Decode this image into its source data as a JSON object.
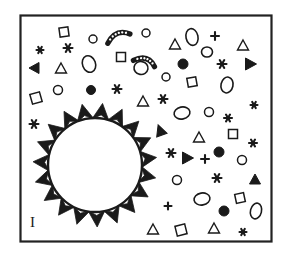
{
  "figure": {
    "panel_label": "I",
    "caption_visible": "",
    "background_color": "#ffffff",
    "ink_color": "#1a1a1a",
    "frame": {
      "x": 20.5,
      "y": 15.5,
      "width": 251,
      "height": 226,
      "stroke_width": 2.2,
      "color": "#222222"
    },
    "central_object": {
      "name": "spiked-circle",
      "center_x": 95,
      "center_y": 165,
      "radius": 47,
      "stroke_width": 2.4,
      "fill": "#ffffff",
      "spike_count": 19,
      "spike_length": 15,
      "spike_half_width": 8.5,
      "spike_notch": 5
    },
    "spike_angles_deg": [
      258,
      277,
      296,
      315,
      334,
      353,
      12,
      31,
      50,
      69,
      88,
      107,
      126,
      145,
      164,
      183,
      202,
      221,
      240
    ],
    "particles": [
      {
        "type": "square-open",
        "x": 64,
        "y": 32,
        "w": 9,
        "h": 9,
        "rot": -8
      },
      {
        "type": "circle-open",
        "x": 93,
        "y": 39,
        "w": 8,
        "h": 8,
        "rot": 0
      },
      {
        "type": "curved-rod",
        "x": 118,
        "y": 36,
        "w": 24,
        "h": 14,
        "rot": -18
      },
      {
        "type": "circle-open",
        "x": 146,
        "y": 33,
        "w": 8,
        "h": 8,
        "rot": 0
      },
      {
        "type": "triangle-open",
        "x": 175,
        "y": 44,
        "w": 11,
        "h": 10,
        "rot": 0
      },
      {
        "type": "ellipse-open",
        "x": 192,
        "y": 37,
        "w": 12,
        "h": 17,
        "rot": -12
      },
      {
        "type": "plus",
        "x": 215,
        "y": 36,
        "w": 8,
        "h": 8,
        "rot": 0
      },
      {
        "type": "triangle-open",
        "x": 243,
        "y": 45,
        "w": 11,
        "h": 10,
        "rot": 0
      },
      {
        "type": "star",
        "x": 40,
        "y": 50,
        "w": 7,
        "h": 7,
        "rot": 0
      },
      {
        "type": "star",
        "x": 68,
        "y": 48,
        "w": 9,
        "h": 9,
        "rot": 0
      },
      {
        "type": "square-open",
        "x": 121,
        "y": 57,
        "w": 9,
        "h": 9,
        "rot": 0
      },
      {
        "type": "curved-rod",
        "x": 145,
        "y": 61,
        "w": 22,
        "h": 14,
        "rot": 22
      },
      {
        "type": "ellipse-open",
        "x": 207,
        "y": 52,
        "w": 11,
        "h": 10,
        "rot": 0
      },
      {
        "type": "triangle-filled",
        "x": 34,
        "y": 68,
        "w": 11,
        "h": 10,
        "rot": -90
      },
      {
        "type": "triangle-open",
        "x": 61,
        "y": 68,
        "w": 11,
        "h": 10,
        "rot": 0
      },
      {
        "type": "ellipse-open",
        "x": 89,
        "y": 64,
        "w": 13,
        "h": 17,
        "rot": -20
      },
      {
        "type": "ellipse-open",
        "x": 141,
        "y": 68,
        "w": 14,
        "h": 13,
        "rot": 10
      },
      {
        "type": "circle-filled",
        "x": 183,
        "y": 64,
        "w": 10,
        "h": 10,
        "rot": 0
      },
      {
        "type": "star",
        "x": 222,
        "y": 64,
        "w": 9,
        "h": 9,
        "rot": 0
      },
      {
        "type": "triangle-filled",
        "x": 251,
        "y": 64,
        "w": 12,
        "h": 11,
        "rot": 90
      },
      {
        "type": "circle-open",
        "x": 166,
        "y": 77,
        "w": 8,
        "h": 8,
        "rot": 0
      },
      {
        "type": "square-open",
        "x": 192,
        "y": 82,
        "w": 9,
        "h": 9,
        "rot": -10
      },
      {
        "type": "ellipse-open",
        "x": 227,
        "y": 85,
        "w": 12,
        "h": 16,
        "rot": 12
      },
      {
        "type": "circle-open",
        "x": 58,
        "y": 90,
        "w": 9,
        "h": 9,
        "rot": 0
      },
      {
        "type": "circle-filled",
        "x": 91,
        "y": 90,
        "w": 9,
        "h": 9,
        "rot": 0
      },
      {
        "type": "star",
        "x": 117,
        "y": 89,
        "w": 9,
        "h": 9,
        "rot": 0
      },
      {
        "type": "square-open",
        "x": 36,
        "y": 98,
        "w": 10,
        "h": 10,
        "rot": -16
      },
      {
        "type": "triangle-open",
        "x": 143,
        "y": 101,
        "w": 11,
        "h": 10,
        "rot": 0
      },
      {
        "type": "star",
        "x": 163,
        "y": 99,
        "w": 9,
        "h": 9,
        "rot": 0
      },
      {
        "type": "star",
        "x": 254,
        "y": 105,
        "w": 7,
        "h": 7,
        "rot": 0
      },
      {
        "type": "ellipse-open",
        "x": 182,
        "y": 113,
        "w": 16,
        "h": 12,
        "rot": -12
      },
      {
        "type": "circle-open",
        "x": 209,
        "y": 112,
        "w": 9,
        "h": 9,
        "rot": 0
      },
      {
        "type": "star",
        "x": 228,
        "y": 118,
        "w": 8,
        "h": 8,
        "rot": 0
      },
      {
        "type": "star",
        "x": 34,
        "y": 124,
        "w": 9,
        "h": 9,
        "rot": 0
      },
      {
        "type": "triangle-filled",
        "x": 160,
        "y": 130,
        "w": 11,
        "h": 11,
        "rot": -20
      },
      {
        "type": "triangle-open",
        "x": 199,
        "y": 137,
        "w": 11,
        "h": 10,
        "rot": 0
      },
      {
        "type": "square-open",
        "x": 233,
        "y": 134,
        "w": 9,
        "h": 9,
        "rot": 0
      },
      {
        "type": "star",
        "x": 253,
        "y": 143,
        "w": 8,
        "h": 8,
        "rot": 0
      },
      {
        "type": "star",
        "x": 171,
        "y": 153,
        "w": 9,
        "h": 9,
        "rot": 0
      },
      {
        "type": "triangle-filled",
        "x": 188,
        "y": 158,
        "w": 12,
        "h": 11,
        "rot": 90
      },
      {
        "type": "plus",
        "x": 205,
        "y": 159,
        "w": 8,
        "h": 8,
        "rot": 0
      },
      {
        "type": "circle-filled",
        "x": 219,
        "y": 152,
        "w": 10,
        "h": 10,
        "rot": 0
      },
      {
        "type": "circle-open",
        "x": 242,
        "y": 160,
        "w": 9,
        "h": 9,
        "rot": 0
      },
      {
        "type": "circle-open",
        "x": 177,
        "y": 180,
        "w": 9,
        "h": 9,
        "rot": 0
      },
      {
        "type": "star",
        "x": 217,
        "y": 178,
        "w": 9,
        "h": 9,
        "rot": 0
      },
      {
        "type": "triangle-filled",
        "x": 255,
        "y": 179,
        "w": 11,
        "h": 10,
        "rot": 0
      },
      {
        "type": "ellipse-open",
        "x": 202,
        "y": 199,
        "w": 16,
        "h": 12,
        "rot": -10
      },
      {
        "type": "square-open",
        "x": 240,
        "y": 198,
        "w": 9,
        "h": 9,
        "rot": -12
      },
      {
        "type": "plus",
        "x": 168,
        "y": 206,
        "w": 7,
        "h": 7,
        "rot": 0
      },
      {
        "type": "circle-filled",
        "x": 224,
        "y": 211,
        "w": 10,
        "h": 10,
        "rot": 0
      },
      {
        "type": "ellipse-open",
        "x": 256,
        "y": 211,
        "w": 11,
        "h": 16,
        "rot": 14
      },
      {
        "type": "triangle-open",
        "x": 153,
        "y": 229,
        "w": 11,
        "h": 10,
        "rot": 0
      },
      {
        "type": "square-open",
        "x": 181,
        "y": 230,
        "w": 10,
        "h": 10,
        "rot": -14
      },
      {
        "type": "triangle-open",
        "x": 214,
        "y": 228,
        "w": 11,
        "h": 10,
        "rot": 0
      },
      {
        "type": "star",
        "x": 243,
        "y": 232,
        "w": 7,
        "h": 7,
        "rot": 0
      }
    ],
    "legend": {
      "shape_names": [
        "circle-open",
        "circle-filled",
        "ellipse-open",
        "triangle-open",
        "triangle-filled",
        "square-open",
        "star",
        "plus",
        "curved-rod"
      ]
    }
  }
}
